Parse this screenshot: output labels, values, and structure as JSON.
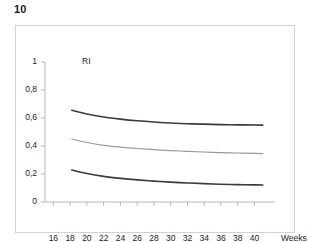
{
  "figure": {
    "number": "10"
  },
  "chart_data": {
    "type": "line",
    "title": "",
    "xlabel": "Weeks",
    "ylabel": "RI",
    "xlim": [
      15,
      41.5
    ],
    "ylim": [
      0,
      1
    ],
    "grid": false,
    "legend": "none",
    "x_ticks": [
      "16",
      "18",
      "20",
      "22",
      "24",
      "26",
      "28",
      "30",
      "32",
      "34",
      "36",
      "38",
      "40"
    ],
    "x_tick_values": [
      16,
      18,
      20,
      22,
      24,
      26,
      28,
      30,
      32,
      34,
      36,
      38,
      40
    ],
    "y_ticks": [
      "0",
      "0,2",
      "0,4",
      "0,6",
      "0,8",
      "1"
    ],
    "y_tick_values": [
      0,
      0.2,
      0.4,
      0.6,
      0.8,
      1
    ],
    "x": [
      18.2,
      20,
      22,
      24,
      26,
      28,
      30,
      32,
      34,
      36,
      38,
      40,
      41
    ],
    "series": [
      {
        "name": "upper-percentile",
        "color": "#3a3a3a",
        "width": 1.6,
        "values": [
          0.655,
          0.628,
          0.607,
          0.592,
          0.58,
          0.571,
          0.564,
          0.559,
          0.556,
          0.553,
          0.551,
          0.55,
          0.549
        ]
      },
      {
        "name": "median",
        "color": "#9a9a9a",
        "width": 1.2,
        "values": [
          0.45,
          0.425,
          0.405,
          0.392,
          0.382,
          0.374,
          0.367,
          0.362,
          0.357,
          0.353,
          0.35,
          0.347,
          0.346
        ]
      },
      {
        "name": "lower-percentile",
        "color": "#3a3a3a",
        "width": 1.6,
        "values": [
          0.228,
          0.203,
          0.183,
          0.169,
          0.158,
          0.149,
          0.142,
          0.136,
          0.131,
          0.127,
          0.124,
          0.122,
          0.121
        ]
      }
    ]
  }
}
